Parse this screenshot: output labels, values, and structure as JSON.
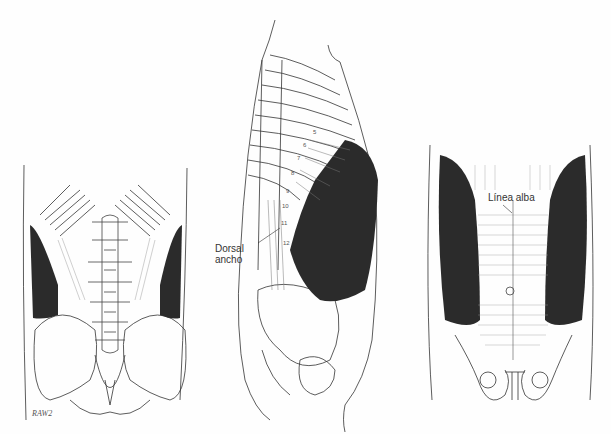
{
  "figure": {
    "panels": [
      {
        "view": "posterior",
        "name": "back-view"
      },
      {
        "view": "lateral",
        "name": "side-view"
      },
      {
        "view": "anterior",
        "name": "front-view"
      }
    ],
    "labels": {
      "dorsal_line1": "Dorsal",
      "dorsal_line2": "ancho",
      "linea_alba": "Línea alba"
    },
    "rib_numbers": [
      "5",
      "6",
      "7",
      "8",
      "9",
      "10",
      "11",
      "12"
    ],
    "signature": "RAW2"
  },
  "colors": {
    "ink": "#222222",
    "muscle_dark": "#2b2b2b",
    "background": "#fefefe"
  }
}
